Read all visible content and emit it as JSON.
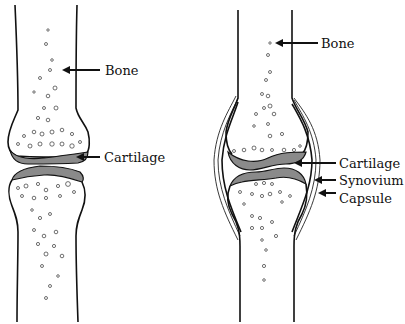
{
  "diagram": {
    "left_panel": {
      "name": "healthy-joint",
      "labels": [
        {
          "id": "bone",
          "text": "Bone"
        },
        {
          "id": "cartilage",
          "text": "Cartilage"
        }
      ]
    },
    "right_panel": {
      "name": "synovial-joint",
      "labels": [
        {
          "id": "bone",
          "text": "Bone"
        },
        {
          "id": "cartilage",
          "text": "Cartilage"
        },
        {
          "id": "synovium",
          "text": "Synovium"
        },
        {
          "id": "capsule",
          "text": "Capsule"
        }
      ]
    },
    "colors": {
      "line": "#111111",
      "cartilage_fill": "#8a8a8a",
      "background": "#ffffff"
    }
  }
}
